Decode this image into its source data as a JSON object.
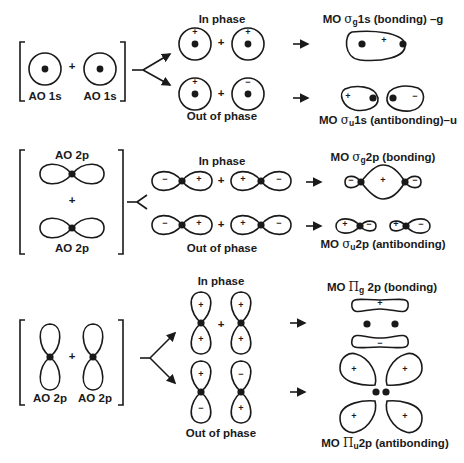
{
  "figure": {
    "row1": {
      "ao_left_label": "AO 1s",
      "ao_right_label": "AO 1s",
      "plus": "+",
      "in_phase_label": "In phase",
      "out_of_phase_label": "Out of phase",
      "in_phase_signs": [
        "+",
        "+"
      ],
      "out_phase_signs": [
        "+",
        "−"
      ],
      "bonding_mo": {
        "prefix": "MO ",
        "symbol": "σ",
        "sub": "g",
        "suffix": "1s (bonding) –g",
        "signs": [
          "+"
        ]
      },
      "antibonding_mo": {
        "prefix": "MO ",
        "symbol": "σ",
        "sub": "u",
        "suffix": "1s (antibonding)–u",
        "signs": [
          "+",
          "−"
        ]
      }
    },
    "row2": {
      "ao_top_label": "AO 2p",
      "ao_bottom_label": "AO 2p",
      "plus": "+",
      "in_phase_label": "In phase",
      "out_of_phase_label": "Out of phase",
      "in_phase_signs": [
        "−",
        "+",
        "+",
        "−"
      ],
      "out_phase_signs": [
        "−",
        "+",
        "+",
        "−"
      ],
      "bonding_mo": {
        "prefix": "MO ",
        "symbol": "σ",
        "sub": "g",
        "suffix": "2p (bonding)",
        "signs": [
          "−",
          "+",
          "−"
        ]
      },
      "antibonding_mo": {
        "prefix": "MO ",
        "symbol": "σ",
        "sub": "u",
        "suffix": "2p (antibonding)",
        "signs": [
          "+",
          "−",
          "+",
          "−"
        ]
      }
    },
    "row3": {
      "ao_left_label": "AO 2p",
      "ao_right_label": "AO 2p",
      "plus": "+",
      "in_phase_label": "In phase",
      "out_of_phase_label": "Out of phase",
      "in_phase_signs": [
        "+",
        "+",
        "+",
        "+"
      ],
      "out_phase_signs": [
        "+",
        "−",
        "−",
        "+"
      ],
      "bonding_mo": {
        "prefix": "MO ",
        "symbol": "Π",
        "sub": "g",
        "suffix": " 2p (bonding)",
        "signs": [
          "+",
          "−"
        ]
      },
      "antibonding_mo": {
        "prefix": "MO ",
        "symbol": "Π",
        "sub": "u",
        "suffix": "2p (antibonding)",
        "signs": [
          "+",
          "+",
          "+",
          "+"
        ]
      }
    }
  }
}
